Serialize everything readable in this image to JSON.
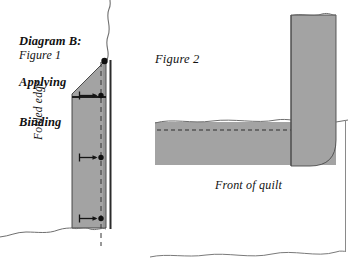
{
  "page": {
    "width": 364,
    "height": 276,
    "background_color": "#ffffff"
  },
  "title": {
    "line1": "Diagram B:",
    "line2": "Applying",
    "line3": "Binding"
  },
  "labels": {
    "figure1": "Figure 1",
    "figure2": "Figure 2",
    "folded_edge": "Folded edge",
    "front_of_quilt": "Front of quilt"
  },
  "colors": {
    "fabric_fill": "#a0a0a0",
    "fabric_fill_light": "#a8a8a8",
    "outline": "#2b2b2b",
    "torn_edge": "#6a6a6a",
    "dashed_guide": "#303030",
    "text": "#111111",
    "page_background": "#ffffff"
  },
  "figure1": {
    "description": "Binding strip folded over the quilt edge, seen from the back, with stitch guide arrows",
    "fabric_shape_points": "72,93 106,60 106,228 72,228",
    "fold_line_y": 97,
    "folded_edge_x": 72,
    "binding_edge_x": 106,
    "dashed_guide_x": 101,
    "dashed_guide_top": 62,
    "dashed_guide_bottom": 245,
    "corner_dot": {
      "x": 104,
      "y": 61,
      "r": 3.1
    },
    "arrow_marks": [
      {
        "y": 96,
        "dot_x": 101,
        "dot_r": 2.6,
        "left_tick_x": 80,
        "arrow_from_x": 81,
        "arrow_to_x": 98
      },
      {
        "y": 158,
        "dot_x": 101,
        "dot_r": 2.6,
        "left_tick_x": 80,
        "arrow_from_x": 81,
        "arrow_to_x": 98
      },
      {
        "y": 219,
        "dot_x": 101,
        "dot_r": 2.6,
        "left_tick_x": 80,
        "arrow_from_x": 81,
        "arrow_to_x": 98
      }
    ],
    "white_strip": {
      "x": 106,
      "width": 4,
      "top": 60,
      "bottom": 229
    },
    "dark_edge_x": 111,
    "torn_top_wave": "M 106,59 C 110,50 104,44 108,34 C 112,24 105,17 109,8 C 111,4 110,2 110,0",
    "torn_bottom_wave": "M 20,232 C 34,228 48,233 62,229 C 68,227 70,228 72,228"
  },
  "figure2": {
    "description": "Binding strip wrapped around the quilt corner, seen from the front",
    "vertical_strip": {
      "x": 291,
      "width": 45,
      "top": 15,
      "bottom": 165,
      "corner_radius": 24
    },
    "horizontal_band": {
      "x": 155,
      "width": 181,
      "top": 122,
      "bottom": 165
    },
    "dashed_stitch_line": {
      "y": 130,
      "from_x": 157,
      "to_x": 290
    },
    "top_torn_wave": "M 155,123 C 175,118 200,123 225,120 C 250,117 270,123 289,120",
    "strip_top_wave": "M 291,16 C 300,13 312,17 324,14 C 330,13 334,15 336,15",
    "bottom_wave": "M 150,257 C 170,253 190,258 212,255 C 236,252 258,258 280,254 C 300,251 320,257 336,252",
    "right_border_x": 345
  }
}
